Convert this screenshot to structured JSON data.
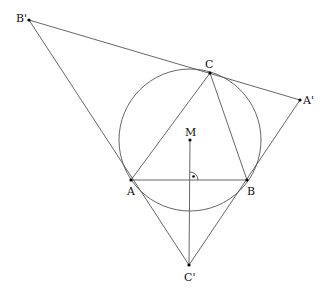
{
  "diagram": {
    "type": "geometry",
    "points": {
      "A": {
        "label": "A",
        "x": 131,
        "y": 180
      },
      "B": {
        "label": "B",
        "x": 247,
        "y": 180
      },
      "C": {
        "label": "C",
        "x": 210,
        "y": 73
      },
      "M": {
        "label": "M",
        "x": 190,
        "y": 140
      },
      "A'": {
        "label": "A'",
        "x": 300,
        "y": 100
      },
      "B'": {
        "label": "B'",
        "x": 29,
        "y": 20
      },
      "C'": {
        "label": "C'",
        "x": 189,
        "y": 265
      }
    },
    "circle": {
      "center": "M",
      "radius": 71
    },
    "segments": [
      [
        "A",
        "B"
      ],
      [
        "B",
        "C"
      ],
      [
        "C",
        "A"
      ],
      [
        "B'",
        "A'"
      ],
      [
        "B'",
        "C'"
      ],
      [
        "A'",
        "C'"
      ],
      [
        "M",
        "C'"
      ]
    ],
    "right_angle_marker": {
      "at": "foot of M on AB",
      "x": 190,
      "y": 180
    },
    "colors": {
      "line": "#555555",
      "point": "#000000",
      "text": "#111111"
    }
  },
  "labels": {
    "A": "A",
    "B": "B",
    "C": "C",
    "M": "M",
    "A_prime": "A'",
    "B_prime": "B'",
    "C_prime": "C'"
  }
}
